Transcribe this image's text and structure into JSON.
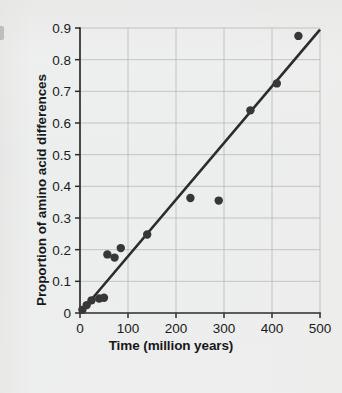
{
  "figure": {
    "background_color": "#eceeed",
    "ink_color": "#2b2b2d",
    "grid_color": "#b9b9b7"
  },
  "chart_data": {
    "type": "scatter",
    "title": "",
    "xlabel": "Time (million years)",
    "ylabel": "Proportion of amino acid differences",
    "xlim": [
      0,
      500
    ],
    "ylim": [
      0,
      0.9
    ],
    "grid": true,
    "legend": null,
    "xticks": [
      0,
      100,
      200,
      300,
      400,
      500
    ],
    "xtick_labels": [
      "0",
      "100",
      "200",
      "300",
      "400",
      "500"
    ],
    "yticks": [
      0,
      0.1,
      0.2,
      0.3,
      0.4,
      0.5,
      0.6,
      0.7,
      0.8,
      0.9
    ],
    "ytick_labels": [
      "0",
      "0.1",
      "0.2",
      "0.3",
      "0.4",
      "0.5",
      "0.6",
      "0.7",
      "0.8",
      "0.9"
    ],
    "points": [
      {
        "x": 5,
        "y": 0.01
      },
      {
        "x": 14,
        "y": 0.025
      },
      {
        "x": 24,
        "y": 0.04
      },
      {
        "x": 40,
        "y": 0.046
      },
      {
        "x": 50,
        "y": 0.048
      },
      {
        "x": 57,
        "y": 0.185
      },
      {
        "x": 72,
        "y": 0.175
      },
      {
        "x": 85,
        "y": 0.205
      },
      {
        "x": 140,
        "y": 0.248
      },
      {
        "x": 230,
        "y": 0.363
      },
      {
        "x": 289,
        "y": 0.355
      },
      {
        "x": 355,
        "y": 0.64
      },
      {
        "x": 410,
        "y": 0.725
      },
      {
        "x": 455,
        "y": 0.875
      }
    ],
    "fit_line": {
      "label": "regression line",
      "x_start": 0,
      "y_start": 0.0,
      "x_end": 500,
      "y_end": 0.895
    }
  },
  "annotations": {
    "edge_mark": "page-edge-mark"
  }
}
